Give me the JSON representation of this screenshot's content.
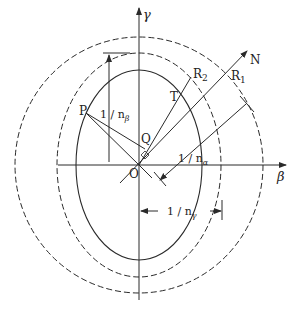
{
  "diagram": {
    "axes": {
      "vertical": "γ",
      "horizontal": "β",
      "origin": "O"
    },
    "points": {
      "P": "P",
      "Q": "Q",
      "T": "T",
      "R1_base": "R",
      "R1_sub": "1",
      "R2_base": "R",
      "R2_sub": "2",
      "N": "N"
    },
    "dimensions": {
      "beta": {
        "prefix": "1 / n",
        "sub": "β"
      },
      "alpha": {
        "prefix": "1 / n",
        "sub": "α"
      },
      "gamma": {
        "prefix": "1 / n",
        "sub": "γ"
      }
    },
    "curves": [
      {
        "name": "inner-ellipse",
        "style": "solid"
      },
      {
        "name": "middle-ellipse",
        "style": "dashed"
      },
      {
        "name": "outer-circle",
        "style": "dashed"
      }
    ],
    "colors": {
      "stroke": "#2a2a2a",
      "background": "#ffffff"
    }
  }
}
